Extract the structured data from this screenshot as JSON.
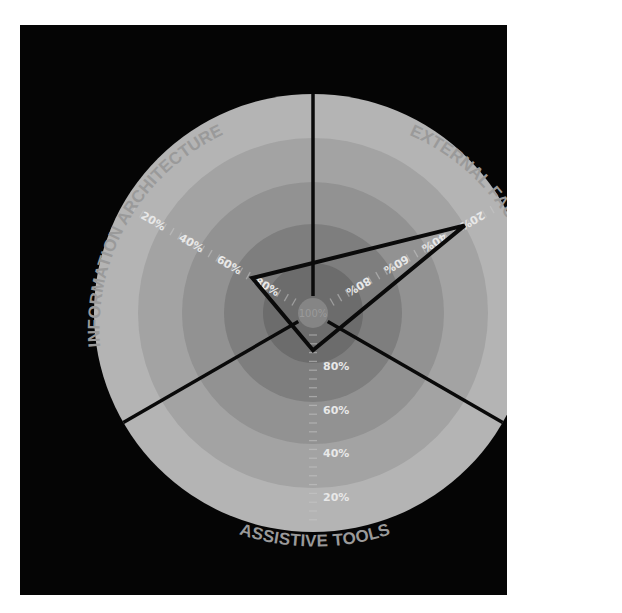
{
  "chart_data": {
    "type": "radar",
    "title": "",
    "axes": [
      "EXTERNAL FACTORS",
      "ASSISTIVE TOOLS",
      "INFORMATION ARCHITECTURE"
    ],
    "axis_angles_deg": [
      60,
      180,
      300
    ],
    "scale": {
      "direction": "center_is_100",
      "center_label": "100%",
      "ticks": [
        "20%",
        "40%",
        "60%",
        "80%"
      ],
      "range": [
        0,
        100
      ]
    },
    "series": [
      {
        "name": "score",
        "values": [
          20,
          83,
          68
        ]
      }
    ],
    "rings": 5,
    "ring_colors": [
      "#b4b4b4",
      "#a3a3a3",
      "#929292",
      "#7e7e7e",
      "#6c6c6c"
    ],
    "center_color": "#808080",
    "sector_dividers_deg": [
      0,
      120,
      240
    ],
    "grid": true,
    "legend": "none"
  },
  "labels": {
    "external_factors": "EXTERNAL FACTORS",
    "assistive_tools": "ASSISTIVE TOOLS",
    "information_architecture": "INFORMATION ARCHITECTURE",
    "center": "100%",
    "ticks": [
      "80%",
      "60%",
      "40%",
      "20%"
    ]
  },
  "colors": {
    "background": "#050505",
    "page": "#ffffff",
    "polygon_stroke": "#0a0a0a",
    "divider": "#0a0a0a",
    "tick_text": "#e8e8e8",
    "axis_text": "#9a9a9a"
  }
}
